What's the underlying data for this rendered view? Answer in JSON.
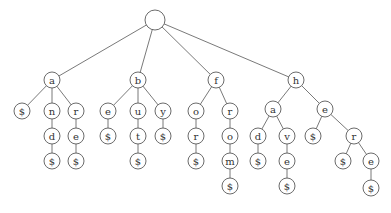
{
  "diagram": {
    "type": "trie",
    "colors": {
      "stroke": "#5a5a5a",
      "fill": "#ffffff",
      "text": "#333333"
    },
    "node_radius": 8,
    "root_radius": 10,
    "nodes": [
      {
        "id": "root",
        "label": "",
        "x": 155,
        "y": 20
      },
      {
        "id": "a",
        "label": "a",
        "x": 52,
        "y": 80
      },
      {
        "id": "b",
        "label": "b",
        "x": 138,
        "y": 80
      },
      {
        "id": "f",
        "label": "f",
        "x": 216,
        "y": 80
      },
      {
        "id": "h",
        "label": "h",
        "x": 296,
        "y": 80
      },
      {
        "id": "a_end",
        "label": "$",
        "x": 22,
        "y": 111
      },
      {
        "id": "an",
        "label": "n",
        "x": 52,
        "y": 111
      },
      {
        "id": "ar",
        "label": "r",
        "x": 76,
        "y": 111
      },
      {
        "id": "and",
        "label": "d",
        "x": 52,
        "y": 136
      },
      {
        "id": "are",
        "label": "e",
        "x": 76,
        "y": 136
      },
      {
        "id": "and_end",
        "label": "$",
        "x": 52,
        "y": 161
      },
      {
        "id": "are_end",
        "label": "$",
        "x": 76,
        "y": 161
      },
      {
        "id": "be",
        "label": "e",
        "x": 108,
        "y": 111
      },
      {
        "id": "bu",
        "label": "u",
        "x": 138,
        "y": 111
      },
      {
        "id": "by",
        "label": "y",
        "x": 163,
        "y": 111
      },
      {
        "id": "be_end",
        "label": "$",
        "x": 108,
        "y": 136
      },
      {
        "id": "but",
        "label": "t",
        "x": 138,
        "y": 136
      },
      {
        "id": "by_end",
        "label": "$",
        "x": 163,
        "y": 136
      },
      {
        "id": "but_end",
        "label": "$",
        "x": 138,
        "y": 161
      },
      {
        "id": "fo",
        "label": "o",
        "x": 196,
        "y": 111
      },
      {
        "id": "fr",
        "label": "r",
        "x": 230,
        "y": 111
      },
      {
        "id": "for",
        "label": "r",
        "x": 196,
        "y": 136
      },
      {
        "id": "fro",
        "label": "o",
        "x": 230,
        "y": 136
      },
      {
        "id": "for_end",
        "label": "$",
        "x": 196,
        "y": 161
      },
      {
        "id": "from",
        "label": "m",
        "x": 230,
        "y": 161
      },
      {
        "id": "from_end",
        "label": "$",
        "x": 230,
        "y": 186
      },
      {
        "id": "ha",
        "label": "a",
        "x": 273,
        "y": 109
      },
      {
        "id": "he",
        "label": "e",
        "x": 325,
        "y": 109
      },
      {
        "id": "had",
        "label": "d",
        "x": 258,
        "y": 136
      },
      {
        "id": "hav",
        "label": "v",
        "x": 287,
        "y": 136
      },
      {
        "id": "he_end",
        "label": "$",
        "x": 313,
        "y": 136
      },
      {
        "id": "her",
        "label": "r",
        "x": 354,
        "y": 136
      },
      {
        "id": "had_end",
        "label": "$",
        "x": 258,
        "y": 161
      },
      {
        "id": "have",
        "label": "e",
        "x": 287,
        "y": 161
      },
      {
        "id": "her_end",
        "label": "$",
        "x": 343,
        "y": 161
      },
      {
        "id": "here",
        "label": "e",
        "x": 371,
        "y": 161
      },
      {
        "id": "have_end",
        "label": "$",
        "x": 287,
        "y": 186
      },
      {
        "id": "here_end",
        "label": "$",
        "x": 371,
        "y": 188
      }
    ],
    "edges": [
      [
        "root",
        "a"
      ],
      [
        "root",
        "b"
      ],
      [
        "root",
        "f"
      ],
      [
        "root",
        "h"
      ],
      [
        "a",
        "a_end"
      ],
      [
        "a",
        "an"
      ],
      [
        "a",
        "ar"
      ],
      [
        "an",
        "and"
      ],
      [
        "and",
        "and_end"
      ],
      [
        "ar",
        "are"
      ],
      [
        "are",
        "are_end"
      ],
      [
        "b",
        "be"
      ],
      [
        "b",
        "bu"
      ],
      [
        "b",
        "by"
      ],
      [
        "be",
        "be_end"
      ],
      [
        "bu",
        "but"
      ],
      [
        "but",
        "but_end"
      ],
      [
        "by",
        "by_end"
      ],
      [
        "f",
        "fo"
      ],
      [
        "f",
        "fr"
      ],
      [
        "fo",
        "for"
      ],
      [
        "for",
        "for_end"
      ],
      [
        "fr",
        "fro"
      ],
      [
        "fro",
        "from"
      ],
      [
        "from",
        "from_end"
      ],
      [
        "h",
        "ha"
      ],
      [
        "h",
        "he"
      ],
      [
        "ha",
        "had"
      ],
      [
        "ha",
        "hav"
      ],
      [
        "had",
        "had_end"
      ],
      [
        "hav",
        "have"
      ],
      [
        "have",
        "have_end"
      ],
      [
        "he",
        "he_end"
      ],
      [
        "he",
        "her"
      ],
      [
        "her",
        "her_end"
      ],
      [
        "her",
        "here"
      ],
      [
        "here",
        "here_end"
      ]
    ],
    "words": [
      "a",
      "and",
      "are",
      "be",
      "but",
      "by",
      "for",
      "from",
      "had",
      "have",
      "he",
      "her",
      "here"
    ]
  }
}
